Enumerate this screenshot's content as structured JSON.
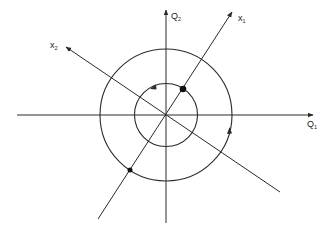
{
  "diagram": {
    "type": "phase-plane",
    "colors": {
      "stroke": "#2a2a2a",
      "background": "#ffffff"
    },
    "axes": {
      "q1": {
        "label": "Q",
        "subscript": "1"
      },
      "q2": {
        "label": "Q",
        "subscript": "2"
      },
      "x1": {
        "label": "x",
        "subscript": "1"
      },
      "x2": {
        "label": "x",
        "subscript": "2"
      }
    },
    "circles": [
      {
        "name": "inner-orbit",
        "radius": 31,
        "direction": "counterclockwise"
      },
      {
        "name": "outer-orbit",
        "radius": 66,
        "direction": "counterclockwise"
      }
    ],
    "points": [
      {
        "name": "inner-point",
        "on": "x1",
        "orbit": "inner"
      },
      {
        "name": "outer-point",
        "on": "x1",
        "orbit": "outer"
      }
    ]
  }
}
